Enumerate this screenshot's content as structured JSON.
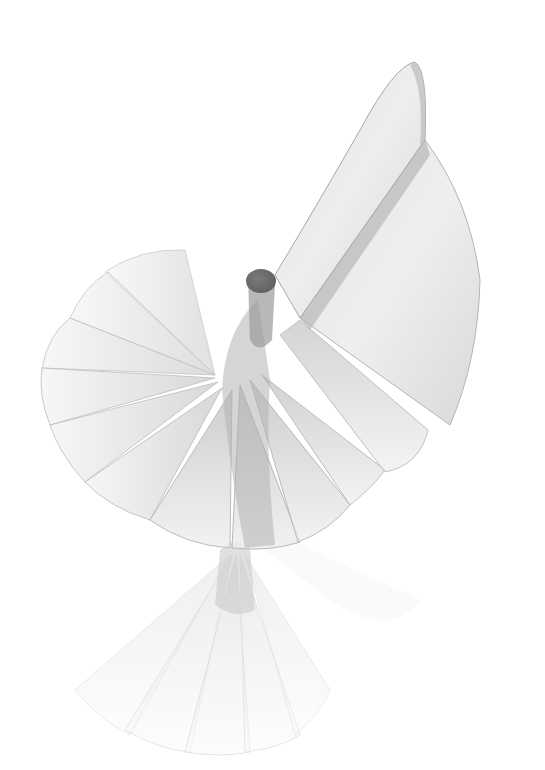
{
  "image": {
    "subject": "translucent white spiral fan sculpture",
    "background_color": "#ffffff",
    "blade_fill": "#e2e2e2",
    "blade_edge": "#b8b8b8",
    "shadow_fill": "#a9a9a9",
    "knob_fill": "#6e6e6e",
    "elements": [
      {
        "name": "top-wing",
        "description": "tall curved blade rising to upper right"
      },
      {
        "name": "central-knob",
        "description": "dark gray cylindrical cap at hub"
      },
      {
        "name": "left-fan",
        "description": "radiating translucent blades fanning left"
      },
      {
        "name": "lower-fan",
        "description": "blades fanning downward from hub"
      },
      {
        "name": "bottom-fan",
        "description": "faded secondary fan below the main cluster"
      }
    ]
  }
}
